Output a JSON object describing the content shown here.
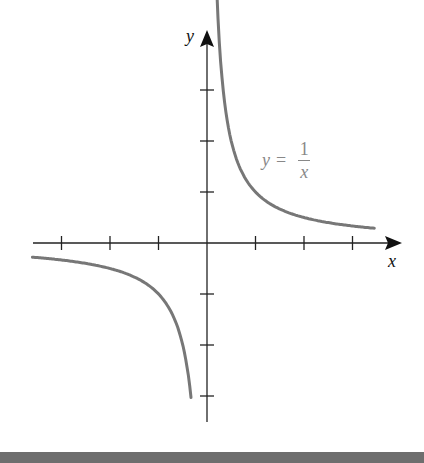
{
  "top_caption": "~ cropped text ~",
  "chart_data": {
    "type": "line",
    "title": "",
    "function": "y = 1/x",
    "xlabel": "x",
    "ylabel": "y",
    "annotation": {
      "lhs": "y",
      "op": "=",
      "num": "1",
      "den": "x"
    },
    "xlim": [
      -3.6,
      3.6
    ],
    "ylim": [
      -3.6,
      3.6
    ],
    "x_ticks": [
      -3,
      -2,
      -1,
      1,
      2,
      3
    ],
    "y_ticks": [
      -3,
      -2,
      -1,
      1,
      2,
      3
    ],
    "tick_labels_shown": false,
    "grid": false,
    "series": [
      {
        "name": "branch-positive",
        "x_range": [
          0.2,
          3.45
        ],
        "color": "#777777"
      },
      {
        "name": "branch-negative",
        "x_range": [
          -3.6,
          -0.33
        ],
        "color": "#777777"
      }
    ],
    "colors": {
      "axes": "#222222",
      "curve": "#777777",
      "footer": "#6e6e6e"
    }
  }
}
